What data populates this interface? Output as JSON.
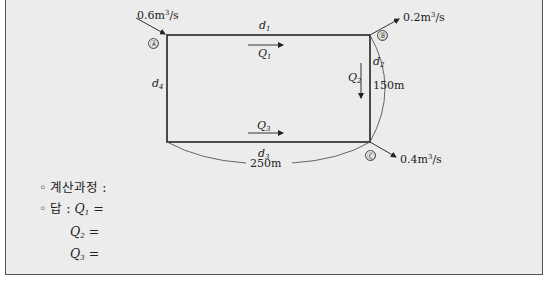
{
  "diagram": {
    "nodes": [
      {
        "id": "A",
        "label": "Ⓐ"
      },
      {
        "id": "B",
        "label": "Ⓑ"
      },
      {
        "id": "C",
        "label": "Ⓒ"
      }
    ],
    "flows": {
      "inflow_A": {
        "value": "0.6m",
        "exp": "3",
        "unit": "/s"
      },
      "outflow_B": {
        "value": "0.2m",
        "exp": "3",
        "unit": "/s"
      },
      "outflow_C": {
        "value": "0.4m",
        "exp": "3",
        "unit": "/s"
      }
    },
    "pipes": {
      "d1": {
        "label": "d",
        "sub": "1"
      },
      "d2": {
        "label": "d",
        "sub": "2"
      },
      "d3": {
        "label": "d",
        "sub": "3"
      },
      "d4": {
        "label": "d",
        "sub": "4"
      }
    },
    "discharges": {
      "Q1": {
        "label": "Q",
        "sub": "1"
      },
      "Q2": {
        "label": "Q",
        "sub": "2"
      },
      "Q3": {
        "label": "Q",
        "sub": "3"
      }
    },
    "dimensions": {
      "height": "150m",
      "width": "250m"
    }
  },
  "answer": {
    "process_label": "◦ 계산과정 :",
    "answer_prefix": "◦ 답 : ",
    "q1": {
      "label": "Q",
      "sub": "1",
      "eq": " ="
    },
    "q2": {
      "label": "Q",
      "sub": "2",
      "eq": " ="
    },
    "q3": {
      "label": "Q",
      "sub": "3",
      "eq": " ="
    }
  }
}
